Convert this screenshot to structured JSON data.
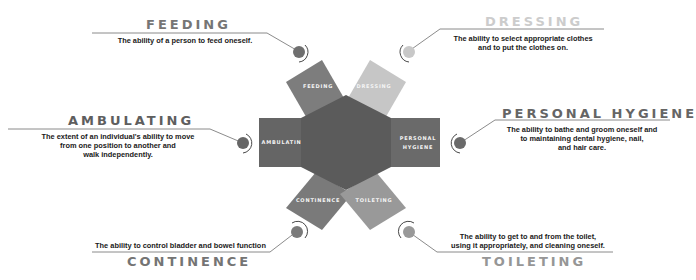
{
  "colors": {
    "hexagon": "#5b5b5b",
    "feeding": "#7d7d7d",
    "dressing": "#c6c6c6",
    "ambulating": "#656565",
    "personal_hygiene": "#6a6a6a",
    "continence": "#7a7a7a",
    "toileting": "#999999",
    "lines": "#6d6d6d"
  },
  "categories": [
    {
      "id": "feeding",
      "title": "FEEDING",
      "panel_label": "FEEDING",
      "description": [
        "The ability of a person to feed oneself."
      ]
    },
    {
      "id": "dressing",
      "title": "DRESSING",
      "panel_label": "DRESSING",
      "description": [
        "The ability to select appropriate clothes",
        "and to put the clothes on."
      ]
    },
    {
      "id": "ambulating",
      "title": "AMBULATING",
      "panel_label": "AMBULATING",
      "description": [
        "The extent of an individual's ability to move",
        "from one position to another and",
        "walk independently."
      ]
    },
    {
      "id": "personal_hygiene",
      "title": "PERSONAL HYGIENE",
      "panel_label": [
        "PERSONAL",
        "HYGIENE"
      ],
      "description": [
        "The ability to bathe and groom oneself and",
        "to maintaining dental hygiene, nail,",
        "and hair care."
      ]
    },
    {
      "id": "continence",
      "title": "CONTINENCE",
      "panel_label": "CONTINENCE",
      "description": [
        "The ability to control bladder and bowel function"
      ]
    },
    {
      "id": "toileting",
      "title": "TOILETING",
      "panel_label": "TOILETING",
      "description": [
        "The ability to get to and from the toilet,",
        "using it appropriately, and cleaning oneself."
      ]
    }
  ]
}
